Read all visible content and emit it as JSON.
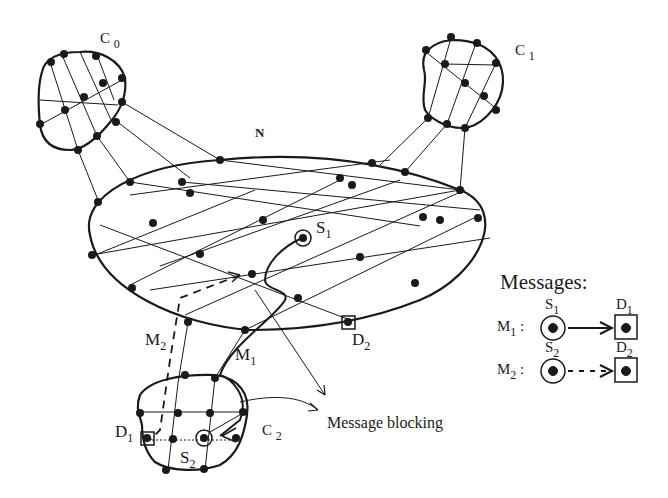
{
  "diagram": {
    "network_label": "N",
    "clusters": [
      {
        "id": "c0",
        "label": "C",
        "sub": "0"
      },
      {
        "id": "c1",
        "label": "C",
        "sub": "1"
      },
      {
        "id": "c2",
        "label": "C",
        "sub": "2"
      }
    ],
    "nodes": {
      "s1": {
        "label": "S",
        "sub": "1"
      },
      "d2": {
        "label": "D",
        "sub": "2"
      },
      "d1": {
        "label": "D",
        "sub": "1"
      },
      "s2": {
        "label": "S",
        "sub": "2"
      }
    },
    "paths": {
      "m1": {
        "label": "M",
        "sub": "1",
        "style": "solid"
      },
      "m2": {
        "label": "M",
        "sub": "2",
        "style": "dashed"
      }
    },
    "annotation": "Message blocking"
  },
  "legend": {
    "title": "Messages:",
    "rows": [
      {
        "msg": "M",
        "msg_sub": "1",
        "src": "S",
        "src_sub": "1",
        "dst": "D",
        "dst_sub": "1",
        "style": "solid"
      },
      {
        "msg": "M",
        "msg_sub": "2",
        "src": "S",
        "src_sub": "2",
        "dst": "D",
        "dst_sub": "2",
        "style": "dashed"
      }
    ]
  },
  "colors": {
    "ink": "#1a1a1a",
    "background": "#ffffff"
  }
}
